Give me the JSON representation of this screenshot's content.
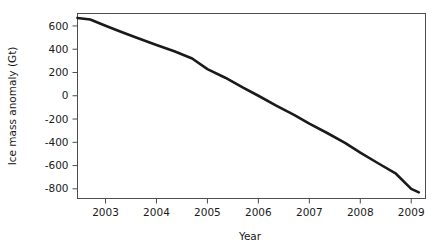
{
  "chart_data": {
    "type": "line",
    "title": "",
    "subtitle": "",
    "xlabel": "Year",
    "ylabel": "Ice mass anomaly (Gt)",
    "xlim": [
      2002.45,
      2009.28
    ],
    "ylim": [
      -883,
      707
    ],
    "grid": false,
    "legend": null,
    "xticks": [
      2003,
      2004,
      2005,
      2006,
      2007,
      2008,
      2009
    ],
    "xtick_labels": [
      "2003",
      "2004",
      "2005",
      "2006",
      "2007",
      "2008",
      "2009"
    ],
    "yticks": [
      600,
      400,
      200,
      0,
      -200,
      -400,
      -600,
      -800
    ],
    "ytick_labels": [
      "600",
      "400",
      "200",
      "0",
      "-200",
      "-400",
      "-600",
      "-800"
    ],
    "series": [
      {
        "name": "Ice mass anomaly",
        "color": "#1a1a1a",
        "line_width": 2.6,
        "x": [
          2002.45,
          2002.7,
          2003.0,
          2003.3,
          2003.6,
          2004.0,
          2004.35,
          2004.7,
          2005.0,
          2005.35,
          2005.7,
          2006.0,
          2006.35,
          2006.7,
          2007.0,
          2007.35,
          2007.7,
          2008.0,
          2008.35,
          2008.7,
          2009.0,
          2009.15
        ],
        "y": [
          669,
          655,
          602,
          550,
          500,
          437,
          382,
          320,
          229,
          155,
          70,
          0,
          -85,
          -165,
          -240,
          -320,
          -405,
          -489,
          -580,
          -670,
          -800,
          -830
        ]
      }
    ]
  },
  "axes": {
    "ylabel": "Ice mass anomaly (Gt)",
    "xlabel": "Year"
  },
  "ticks": {
    "y": [
      {
        "label": "600"
      },
      {
        "label": "400"
      },
      {
        "label": "200"
      },
      {
        "label": "0"
      },
      {
        "label": "-200"
      },
      {
        "label": "-400"
      },
      {
        "label": "-600"
      },
      {
        "label": "-800"
      }
    ],
    "x": [
      {
        "label": "2003"
      },
      {
        "label": "2004"
      },
      {
        "label": "2005"
      },
      {
        "label": "2006"
      },
      {
        "label": "2007"
      },
      {
        "label": "2008"
      },
      {
        "label": "2009"
      }
    ]
  },
  "colors": {
    "line": "#1a1a1a",
    "axis": "#4d4d4d",
    "text": "#1a1a1a",
    "background": "#ffffff"
  }
}
